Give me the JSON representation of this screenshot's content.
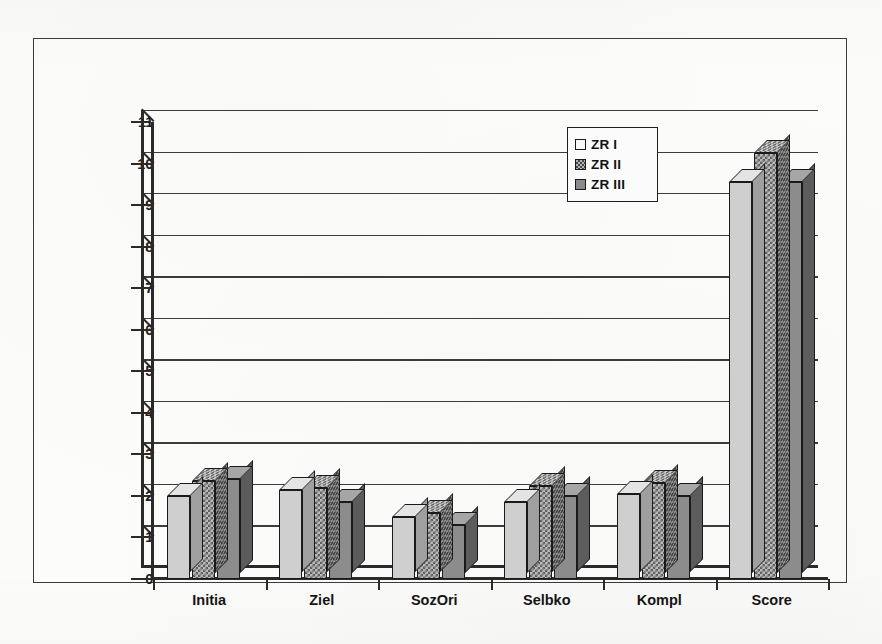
{
  "chart_data": {
    "type": "bar",
    "title": "",
    "subtitle": "",
    "xlabel": "",
    "ylabel": "",
    "ylim": [
      0,
      11
    ],
    "ytick_step": 1,
    "yticks": [
      "11",
      "10",
      "9",
      "8",
      "7",
      "6",
      "5",
      "4",
      "3",
      "2",
      "1",
      "0"
    ],
    "grid": true,
    "three_d": true,
    "legend_position": "top-right",
    "categories": [
      "Initia",
      "Ziel",
      "SozOri",
      "Selbko",
      "Kompl",
      "Score"
    ],
    "series": [
      {
        "name": "ZR I",
        "fill": "light-gray",
        "color": "#cfcfcf",
        "values": [
          2.0,
          2.15,
          1.5,
          1.85,
          2.05,
          9.55
        ]
      },
      {
        "name": "ZR II",
        "fill": "checkerboard",
        "color": "#b9b9b9",
        "values": [
          2.35,
          2.2,
          1.6,
          2.25,
          2.3,
          10.25
        ]
      },
      {
        "name": "ZR III",
        "fill": "medium-gray",
        "color": "#8c8c8c",
        "values": [
          2.4,
          1.85,
          1.3,
          2.0,
          2.0,
          9.55
        ]
      }
    ],
    "legend": [
      {
        "label": "ZR I",
        "swatch": "sw1"
      },
      {
        "label": "ZR II",
        "swatch": "sw2"
      },
      {
        "label": "ZR III",
        "swatch": "sw3"
      }
    ]
  }
}
